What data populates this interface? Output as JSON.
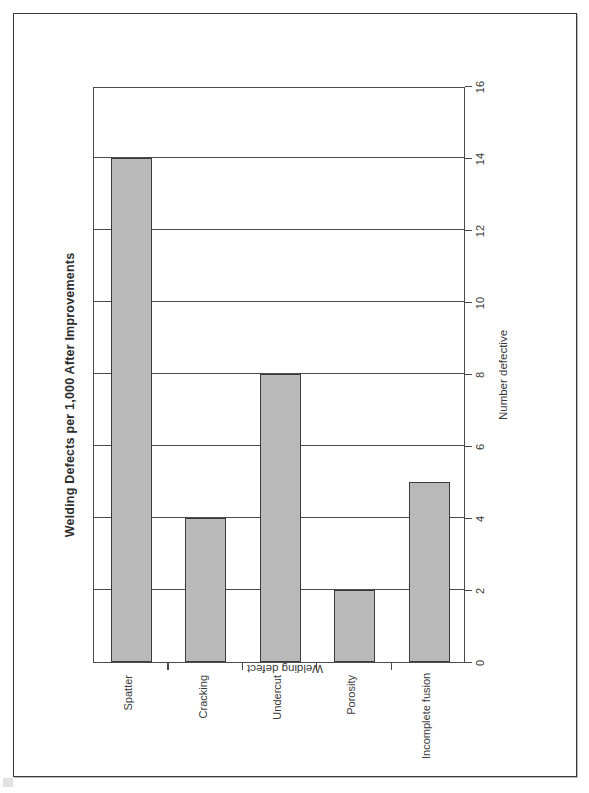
{
  "chart_data": {
    "type": "bar",
    "orientation": "horizontal",
    "title": "Welding Defects per 1,000 After Improvements",
    "xlabel": "Number defective",
    "ylabel": "Welding defect",
    "categories": [
      "Spatter",
      "Cracking",
      "Undercut",
      "Porosity",
      "Incomplete fusion"
    ],
    "values": [
      14,
      4,
      8,
      2,
      5
    ],
    "xlim": [
      0,
      16
    ],
    "xticks": [
      0,
      2,
      4,
      6,
      8,
      10,
      12,
      14,
      16
    ],
    "xtick_labels": [
      "0",
      "2",
      "4",
      "6",
      "8",
      "10",
      "12",
      "14",
      "16"
    ],
    "grid": "vertical",
    "legend": "none",
    "bar_fill": "#b9b9b9",
    "bar_edge": "#3b3b3b",
    "series": [
      {
        "name": "Number defective",
        "points": [
          {
            "category": "Spatter",
            "value": 14
          },
          {
            "category": "Cracking",
            "value": 4
          },
          {
            "category": "Undercut",
            "value": 8
          },
          {
            "category": "Porosity",
            "value": 2
          },
          {
            "category": "Incomplete fusion",
            "value": 5
          }
        ]
      }
    ]
  },
  "page": {
    "border_color": "#3a3a3a",
    "background": "#ffffff"
  }
}
